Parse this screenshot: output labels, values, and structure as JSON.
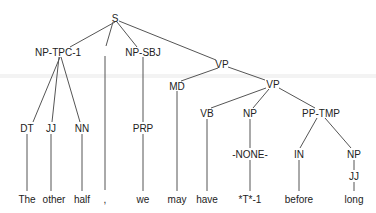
{
  "diagram": {
    "type": "parse-tree",
    "nodes": [
      {
        "id": "S",
        "label": "S",
        "x": 115,
        "y": 18
      },
      {
        "id": "NPTPC",
        "label": "NP-TPC-1",
        "x": 58,
        "y": 52
      },
      {
        "id": "COMMA_NODE",
        "label": "",
        "x": 105,
        "y": 47
      },
      {
        "id": "NPSBJ",
        "label": "NP-SBJ",
        "x": 143,
        "y": 52
      },
      {
        "id": "VP1",
        "label": "VP",
        "x": 222,
        "y": 64
      },
      {
        "id": "MD",
        "label": "MD",
        "x": 177,
        "y": 86
      },
      {
        "id": "VP2",
        "label": "VP",
        "x": 273,
        "y": 84
      },
      {
        "id": "DT",
        "label": "DT",
        "x": 27,
        "y": 128
      },
      {
        "id": "JJ1",
        "label": "JJ",
        "x": 51,
        "y": 128
      },
      {
        "id": "NN",
        "label": "NN",
        "x": 82,
        "y": 128
      },
      {
        "id": "PRP",
        "label": "PRP",
        "x": 143,
        "y": 128
      },
      {
        "id": "VB",
        "label": "VB",
        "x": 207,
        "y": 113
      },
      {
        "id": "NP2",
        "label": "NP",
        "x": 250,
        "y": 113
      },
      {
        "id": "PPTMP",
        "label": "PP-TMP",
        "x": 321,
        "y": 113
      },
      {
        "id": "NONE",
        "label": "-NONE-",
        "x": 250,
        "y": 154
      },
      {
        "id": "IN",
        "label": "IN",
        "x": 299,
        "y": 154
      },
      {
        "id": "NP3",
        "label": "NP",
        "x": 354,
        "y": 154
      },
      {
        "id": "JJ2",
        "label": "JJ",
        "x": 354,
        "y": 176
      }
    ],
    "leaves": [
      {
        "id": "w1",
        "label": "The",
        "x": 27,
        "y": 199
      },
      {
        "id": "w2",
        "label": "other",
        "x": 54,
        "y": 199
      },
      {
        "id": "w3",
        "label": "half",
        "x": 82,
        "y": 199
      },
      {
        "id": "w4",
        "label": ",",
        "x": 105,
        "y": 199
      },
      {
        "id": "w5",
        "label": "we",
        "x": 143,
        "y": 199
      },
      {
        "id": "w6",
        "label": "may",
        "x": 177,
        "y": 199
      },
      {
        "id": "w7",
        "label": "have",
        "x": 207,
        "y": 199
      },
      {
        "id": "w8",
        "label": "*T*-1",
        "x": 250,
        "y": 199
      },
      {
        "id": "w9",
        "label": "before",
        "x": 299,
        "y": 199
      },
      {
        "id": "w10",
        "label": "long",
        "x": 354,
        "y": 199
      }
    ],
    "edges": [
      [
        115,
        22,
        70,
        47
      ],
      [
        113,
        22,
        106,
        46
      ],
      [
        117,
        22,
        137,
        47
      ],
      [
        119,
        21,
        216,
        60
      ],
      [
        60,
        57,
        33,
        122
      ],
      [
        59,
        57,
        52,
        122
      ],
      [
        61,
        57,
        80,
        122
      ],
      [
        105,
        56,
        105,
        190
      ],
      [
        143,
        57,
        143,
        122
      ],
      [
        218,
        68,
        181,
        81
      ],
      [
        228,
        67,
        265,
        80
      ],
      [
        177,
        91,
        177,
        191
      ],
      [
        266,
        88,
        211,
        108
      ],
      [
        269,
        89,
        253,
        108
      ],
      [
        279,
        88,
        315,
        108
      ],
      [
        27,
        134,
        27,
        191
      ],
      [
        51,
        134,
        51,
        191
      ],
      [
        82,
        134,
        82,
        191
      ],
      [
        143,
        134,
        143,
        191
      ],
      [
        207,
        119,
        207,
        191
      ],
      [
        250,
        119,
        250,
        148
      ],
      [
        250,
        160,
        250,
        191
      ],
      [
        317,
        118,
        300,
        148
      ],
      [
        325,
        118,
        351,
        148
      ],
      [
        299,
        160,
        299,
        191
      ],
      [
        354,
        160,
        354,
        170
      ],
      [
        354,
        182,
        354,
        191
      ]
    ]
  }
}
